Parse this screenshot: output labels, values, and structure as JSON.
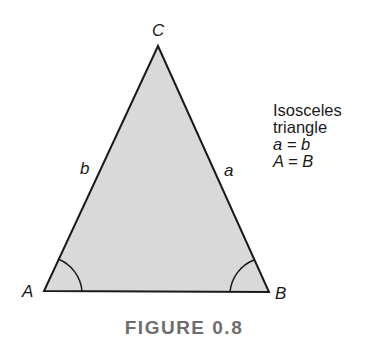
{
  "figure": {
    "caption": "FIGURE 0.8",
    "vertices": {
      "A": {
        "label": "A",
        "x": 44,
        "y": 291
      },
      "B": {
        "label": "B",
        "x": 269,
        "y": 292
      },
      "C": {
        "label": "C",
        "x": 158,
        "y": 46
      }
    },
    "sides": {
      "a": {
        "label": "a"
      },
      "b": {
        "label": "b"
      }
    },
    "annotation": {
      "line1": "Isosceles",
      "line2": "triangle",
      "line3": "a = b",
      "line4": "A = B"
    },
    "colors": {
      "fill": "#d9d9d9",
      "stroke": "#1a1a1a",
      "caption": "#6e6e6e"
    }
  }
}
